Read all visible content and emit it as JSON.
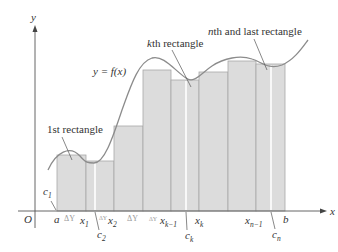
{
  "figure": {
    "colors": {
      "rect_fill": "#dcdcdc",
      "rect_stroke": "#a8a8a8",
      "curve": "#8c8c8c",
      "axis": "#555555",
      "text": "#333333",
      "gap": "#ffffff"
    },
    "axes": {
      "x_label": "x",
      "y_label": "y",
      "origin_label": "O"
    },
    "curve_label": "y = f(x)",
    "annotations": {
      "first": "1st rectangle",
      "kth": "kth rectangle",
      "kth_k": "k",
      "kth_rest": "th rectangle",
      "nth_n": "n",
      "nth_rest": "th and last rectangle"
    },
    "x_ticks": {
      "a": "a",
      "x1": "x",
      "x1_sub": "1",
      "x2": "x",
      "x2_sub": "2",
      "xk1": "x",
      "xk1_sub": "k−1",
      "xk": "x",
      "xk_sub": "k",
      "xn1": "x",
      "xn1_sub": "n−1",
      "b": "b"
    },
    "delta_labels": [
      "ΔY",
      "ΔY",
      "ΔY",
      "ΔY"
    ],
    "c_labels": {
      "c1": "c",
      "c1_sub": "1",
      "c2": "c",
      "c2_sub": "2",
      "ck": "c",
      "ck_sub": "k",
      "cn": "c",
      "cn_sub": "n"
    },
    "rectangles": [
      {
        "index": 1,
        "x0": 57,
        "x1": 86,
        "top": 155
      },
      {
        "index": 2,
        "x0": 86,
        "x1": 114,
        "top": 161
      },
      {
        "index": 3,
        "x0": 114,
        "x1": 143,
        "top": 126
      },
      {
        "index": 4,
        "x0": 143,
        "x1": 171,
        "top": 70
      },
      {
        "index": 5,
        "x0": 171,
        "x1": 199,
        "top": 80
      },
      {
        "index": 6,
        "x0": 199,
        "x1": 228,
        "top": 72
      },
      {
        "index": 7,
        "x0": 228,
        "x1": 256,
        "top": 61
      },
      {
        "index": 8,
        "x0": 256,
        "x1": 285,
        "top": 64
      }
    ]
  }
}
